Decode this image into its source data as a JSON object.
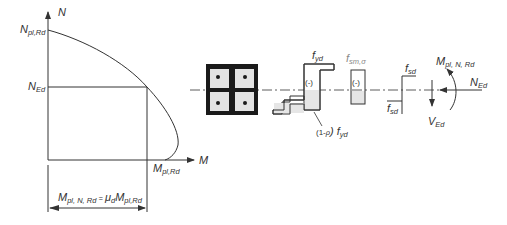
{
  "interaction_diagram": {
    "axis_n_label": "N",
    "axis_m_label": "M",
    "n_pl_rd": {
      "main": "N",
      "sub": "pl,Rd"
    },
    "n_ed": {
      "main": "N",
      "sub": "Ed"
    },
    "m_pl_rd": {
      "main": "M",
      "sub": "pl,Rd"
    },
    "dimension": {
      "m1_main": "M",
      "m1_sub": "pl, N, Rd",
      "eq": " = ",
      "mu_main": "μ",
      "mu_sub": "d",
      "m2_main": "M",
      "m2_sub": "pl,Rd"
    }
  },
  "stress_blocks": {
    "steel_label": {
      "main": "f",
      "sub": "yd"
    },
    "steel_sign": "(-)",
    "steel_reduced": {
      "prefix": "(1-",
      "rho": "ρ",
      "suffix": ") f",
      "sub": "yd"
    },
    "concrete_label": {
      "main": "f",
      "sub": "sm,σ"
    },
    "concrete_sign": "(-)",
    "rebar_top": {
      "main": "f",
      "sub": "sd"
    },
    "rebar_bottom": {
      "main": "f",
      "sub": "sd"
    }
  },
  "forces": {
    "moment": {
      "main": "M",
      "sub": "pl, N, Rd"
    },
    "axial": {
      "main": "N",
      "sub": "Ed"
    },
    "shear": {
      "main": "V",
      "sub": "Ed"
    }
  },
  "colors": {
    "line": "#333333",
    "fill": "#e6e6e6",
    "steel": "#1a1a1a"
  }
}
